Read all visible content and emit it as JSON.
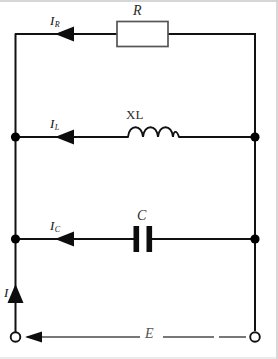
{
  "figure": {
    "kind": "circuit-diagram",
    "title_text": "",
    "canvas": {
      "width": 278,
      "height": 359
    },
    "colors": {
      "wire": "#111111",
      "component_outline": "#555555",
      "component_fill": "#ffffff",
      "capacitor_plate": "#0d0d0d",
      "junction_dot": "#000000",
      "terminal_ring": "#111111",
      "frame_border": "#c9c9c9",
      "label_text": "#111111",
      "background": "#ffffff"
    }
  },
  "branches": [
    {
      "id": "resistive-branch",
      "component": "resistor",
      "component_label": "R",
      "current_label": "I",
      "current_subscript": "R",
      "current_direction": "right"
    },
    {
      "id": "inductive-branch",
      "component": "inductor",
      "component_label": "XL",
      "current_label": "I",
      "current_subscript": "L",
      "current_direction": "right"
    },
    {
      "id": "capacitive-branch",
      "component": "capacitor",
      "component_label": "C",
      "current_label": "I",
      "current_subscript": "C",
      "current_direction": "right"
    }
  ],
  "source": {
    "id": "supply",
    "voltage_label": "E",
    "voltage_direction": "left",
    "total_current_label": "I",
    "total_current_direction": "up",
    "terminal_left_name": "open-terminal",
    "terminal_right_name": "open-terminal"
  },
  "nodes": {
    "junction_count": 4,
    "terminal_count": 2
  }
}
